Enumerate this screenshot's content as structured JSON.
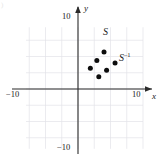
{
  "figure": {
    "corner_mark": ")",
    "axis_labels": {
      "x": "x",
      "y": "y"
    },
    "tick_labels": {
      "x_max": "10",
      "x_min": "−10",
      "y_max": "10",
      "y_min": "−10"
    },
    "annotations": [
      {
        "id": "set-s",
        "text": "S",
        "x": 103,
        "y": 27
      },
      {
        "id": "set-s-inverse",
        "text": "S",
        "sup": "–1",
        "x": 119,
        "y": 52
      }
    ],
    "colors": {
      "axis": "#2b2b2b",
      "grid": "#e3e3e8",
      "point": "#0d0d0d",
      "text": "#1a1a1a",
      "background": "#ffffff"
    }
  },
  "chart_data": {
    "type": "scatter",
    "title": "",
    "xlabel": "x",
    "ylabel": "y",
    "xlim": [
      -10,
      10
    ],
    "ylim": [
      -10,
      10
    ],
    "xticks": [
      -10,
      10
    ],
    "yticks": [
      -10,
      10
    ],
    "grid": true,
    "grid_step": 2.5,
    "series": [
      {
        "name": "S",
        "marker": "filled-circle",
        "color": "#0d0d0d",
        "points": [
          {
            "x": 1.9,
            "y": 3.2
          },
          {
            "x": 2.9,
            "y": 4.4
          },
          {
            "x": 4.0,
            "y": 5.7
          }
        ]
      },
      {
        "name": "S^-1",
        "marker": "filled-circle",
        "color": "#0d0d0d",
        "points": [
          {
            "x": 3.2,
            "y": 1.9
          },
          {
            "x": 4.4,
            "y": 2.9
          },
          {
            "x": 5.7,
            "y": 4.0
          }
        ]
      }
    ]
  }
}
